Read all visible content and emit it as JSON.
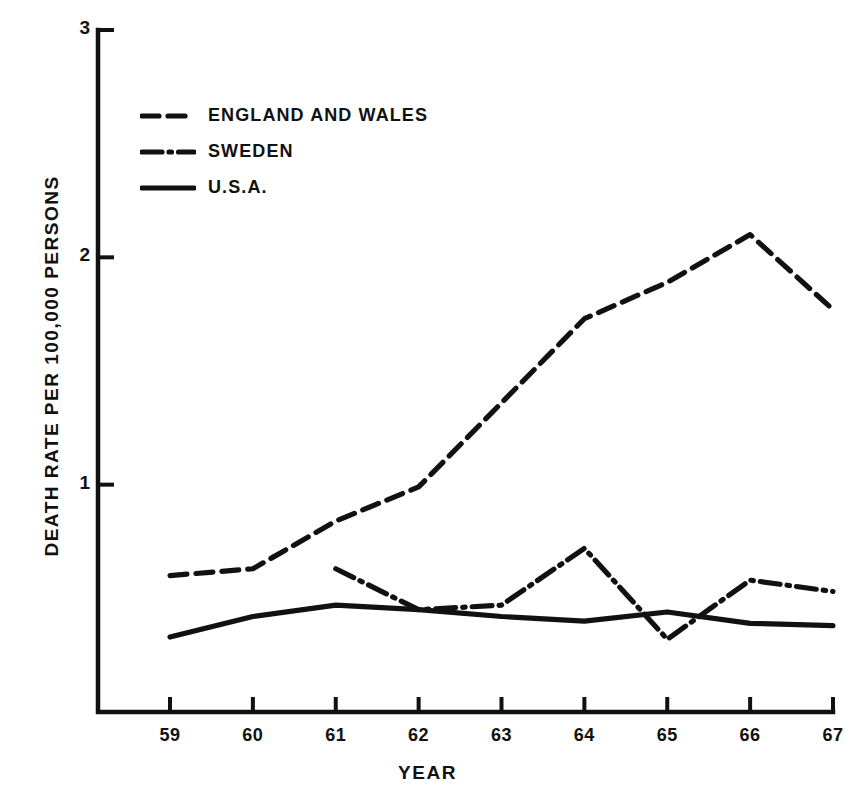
{
  "chart_data": {
    "type": "line",
    "title": "",
    "xlabel": "YEAR",
    "ylabel": "DEATH RATE PER 100,000 PERSONS",
    "x": [
      59,
      60,
      61,
      62,
      63,
      64,
      65,
      66,
      67
    ],
    "categories": [
      "59",
      "60",
      "61",
      "62",
      "63",
      "64",
      "65",
      "66",
      "67"
    ],
    "xlim": [
      58.6,
      67.2
    ],
    "ylim": [
      0,
      3
    ],
    "yticks": [
      1,
      2,
      3
    ],
    "ytick_labels": [
      "1",
      "2",
      "3"
    ],
    "grid": false,
    "legend_position": "upper-left",
    "series": [
      {
        "name": "ENGLAND AND WALES",
        "style": "dashed",
        "color": "#111111",
        "x": [
          59,
          60,
          61,
          62,
          63,
          64,
          65,
          66,
          67
        ],
        "values": [
          0.6,
          0.63,
          0.84,
          0.99,
          1.36,
          1.73,
          1.89,
          2.1,
          1.77
        ]
      },
      {
        "name": "SWEDEN",
        "style": "dash-dot",
        "color": "#111111",
        "x": [
          61,
          62,
          63,
          64,
          65,
          66,
          67
        ],
        "values": [
          0.63,
          0.45,
          0.47,
          0.72,
          0.32,
          0.58,
          0.53
        ]
      },
      {
        "name": "U.S.A.",
        "style": "solid",
        "color": "#111111",
        "x": [
          59,
          60,
          61,
          62,
          63,
          64,
          65,
          66,
          67
        ],
        "values": [
          0.33,
          0.42,
          0.47,
          0.45,
          0.42,
          0.4,
          0.44,
          0.39,
          0.38
        ]
      }
    ]
  },
  "axes": {
    "y_title": "DEATH RATE PER 100,000 PERSONS",
    "x_title": "YEAR",
    "y_ticks": [
      "3",
      "2",
      "1"
    ],
    "x_ticks": [
      "59",
      "60",
      "61",
      "62",
      "63",
      "64",
      "65",
      "66",
      "67"
    ]
  },
  "legend": {
    "items": [
      {
        "label": "ENGLAND AND WALES",
        "style": "dashed"
      },
      {
        "label": "SWEDEN",
        "style": "dash-dot"
      },
      {
        "label": "U.S.A.",
        "style": "solid"
      }
    ]
  }
}
